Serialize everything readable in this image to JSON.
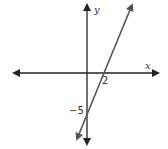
{
  "diagram": {
    "type": "linear-function-graph",
    "axes": {
      "x_label": "x",
      "y_label": "y"
    },
    "line": {
      "x_intercept": 2,
      "y_intercept": -5,
      "x_intercept_label": "2",
      "y_intercept_label": "−5",
      "slope": 2.5
    },
    "colors": {
      "axis": "#222222",
      "line": "#555555",
      "text": "#333333",
      "background": "#ffffff"
    }
  }
}
